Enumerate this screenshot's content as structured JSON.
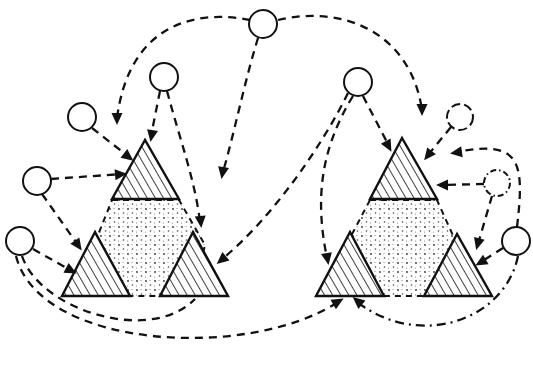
{
  "diagram": {
    "colors": {
      "ink": "#111111",
      "background": "#ffffff"
    },
    "clusters": [
      {
        "id": "left-cluster",
        "triangles": [
          {
            "id": "left-top",
            "points": "145,140 112,199 179,199"
          },
          {
            "id": "left-bottom-left",
            "points": "95,232 62,296 130,296"
          },
          {
            "id": "left-bottom-right",
            "points": "193,232 160,296 228,296"
          }
        ],
        "center": {
          "points": "112,200 179,200 205,245 193,296 130,296 96,240"
        }
      },
      {
        "id": "right-cluster",
        "triangles": [
          {
            "id": "right-top",
            "points": "402,138 370,199 437,199"
          },
          {
            "id": "right-bottom-left",
            "points": "350,232 316,296 384,296"
          },
          {
            "id": "right-bottom-right",
            "points": "457,234 424,296 492,296"
          }
        ],
        "center": {
          "points": "370,200 437,200 455,240 424,296 384,296 350,238"
        }
      }
    ],
    "nodes": [
      {
        "id": "top-center",
        "cx": 263,
        "cy": 24,
        "r": 14,
        "style": "solid"
      },
      {
        "id": "left-n1",
        "cx": 164,
        "cy": 77,
        "r": 14,
        "style": "solid"
      },
      {
        "id": "left-n2",
        "cx": 82,
        "cy": 117,
        "r": 14,
        "style": "solid"
      },
      {
        "id": "left-n3",
        "cx": 37,
        "cy": 181,
        "r": 14,
        "style": "solid"
      },
      {
        "id": "left-n4",
        "cx": 20,
        "cy": 241,
        "r": 14,
        "style": "solid"
      },
      {
        "id": "right-n1",
        "cx": 358,
        "cy": 82,
        "r": 14,
        "style": "solid"
      },
      {
        "id": "right-n2",
        "cx": 460,
        "cy": 117,
        "r": 13,
        "style": "dashed"
      },
      {
        "id": "right-n3",
        "cx": 497,
        "cy": 183,
        "r": 13,
        "style": "dot-dash"
      },
      {
        "id": "right-n4",
        "cx": 516,
        "cy": 241,
        "r": 14,
        "style": "solid"
      }
    ],
    "edges": [
      {
        "id": "top-to-left-top",
        "d": "M 250,20 C 200,10 130,20 117,118",
        "style": "dashed"
      },
      {
        "id": "top-to-center-gap",
        "d": "M 258,38 C 245,80 235,130 223,172",
        "style": "dashed"
      },
      {
        "id": "top-to-right-top",
        "d": "M 278,20 C 340,5 410,30 422,110",
        "style": "dashed"
      },
      {
        "id": "ln1-to-left-top",
        "d": "M 160,91 L 151,136",
        "style": "dashed"
      },
      {
        "id": "ln1-to-left-br",
        "d": "M 167,91 C 180,140 195,180 200,222",
        "style": "dashed"
      },
      {
        "id": "ln2-to-left-top",
        "d": "M 92,128 L 129,157",
        "style": "dashed"
      },
      {
        "id": "ln3-to-left-top",
        "d": "M 51,179 L 122,174",
        "style": "dashed"
      },
      {
        "id": "ln3-to-left-bl",
        "d": "M 42,194 L 78,245",
        "style": "dashed"
      },
      {
        "id": "ln4-to-left-bl",
        "d": "M 33,249 L 72,271",
        "style": "dashed"
      },
      {
        "id": "ln4-loop-under-left",
        "d": "M 22,256 C 40,310 150,345 195,299",
        "style": "dashed"
      },
      {
        "id": "ln4-to-right-bl",
        "d": "M 16,256 C 40,350 250,360 338,302",
        "style": "dashed"
      },
      {
        "id": "rn1-to-left-br",
        "d": "M 348,93 C 320,150 270,220 221,260",
        "style": "dashed"
      },
      {
        "id": "rn1-to-right-bl",
        "d": "M 353,96 C 320,150 315,200 327,258",
        "style": "dashed"
      },
      {
        "id": "rn1-to-right-top",
        "d": "M 363,96 L 389,146",
        "style": "dashed"
      },
      {
        "id": "rn2-to-right-top",
        "d": "M 451,127 L 428,155",
        "style": "dashed"
      },
      {
        "id": "rn3-to-right-top",
        "d": "M 484,184 L 441,185",
        "style": "dashed"
      },
      {
        "id": "rn3-to-right-br",
        "d": "M 492,196 L 478,244",
        "style": "dashed"
      },
      {
        "id": "rn4-to-right-br",
        "d": "M 503,248 L 481,262",
        "style": "dashed"
      },
      {
        "id": "rn4-loop-to-rn2",
        "d": "M 517,227 C 525,160 520,140 456,152",
        "style": "dashed"
      },
      {
        "id": "rn4-loop-under-right",
        "d": "M 518,256 C 505,320 420,350 357,302",
        "style": "dash-dot"
      }
    ],
    "arrowheads": [
      {
        "x": 117,
        "y": 122,
        "angle": 90
      },
      {
        "x": 222,
        "y": 176,
        "angle": 100
      },
      {
        "x": 422,
        "y": 113,
        "angle": 90
      },
      {
        "x": 151,
        "y": 139,
        "angle": 100
      },
      {
        "x": 201,
        "y": 225,
        "angle": 85
      },
      {
        "x": 131,
        "y": 159,
        "angle": 38
      },
      {
        "x": 124,
        "y": 174,
        "angle": -5
      },
      {
        "x": 80,
        "y": 248,
        "angle": 55
      },
      {
        "x": 74,
        "y": 272,
        "angle": 28
      },
      {
        "x": 219,
        "y": 262,
        "angle": 140
      },
      {
        "x": 341,
        "y": 300,
        "angle": -30
      },
      {
        "x": 328,
        "y": 262,
        "angle": 80
      },
      {
        "x": 390,
        "y": 149,
        "angle": 62
      },
      {
        "x": 426,
        "y": 158,
        "angle": 128
      },
      {
        "x": 439,
        "y": 185,
        "angle": 180
      },
      {
        "x": 477,
        "y": 247,
        "angle": 105
      },
      {
        "x": 478,
        "y": 264,
        "angle": 150
      },
      {
        "x": 453,
        "y": 153,
        "angle": 172
      },
      {
        "x": 355,
        "y": 299,
        "angle": 220
      }
    ]
  }
}
